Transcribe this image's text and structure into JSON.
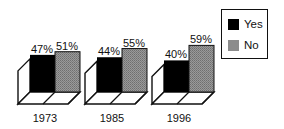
{
  "chart_data": {
    "type": "bar",
    "style": "3d-grouped",
    "title": "",
    "xlabel": "",
    "ylabel": "",
    "categories": [
      "1973",
      "1985",
      "1996"
    ],
    "series": [
      {
        "name": "Yes",
        "color": "#000000",
        "values": [
          47,
          44,
          40
        ],
        "labels": [
          "47%",
          "44%",
          "40%"
        ]
      },
      {
        "name": "No",
        "color": "#8c8c8c",
        "values": [
          51,
          55,
          59
        ],
        "labels": [
          "51%",
          "55%",
          "59%"
        ]
      }
    ],
    "grid": false,
    "legend_position": "top-right"
  },
  "legend": {
    "items": [
      {
        "label": "Yes",
        "color": "#000000"
      },
      {
        "label": "No",
        "color": "#8c8c8c"
      }
    ]
  }
}
